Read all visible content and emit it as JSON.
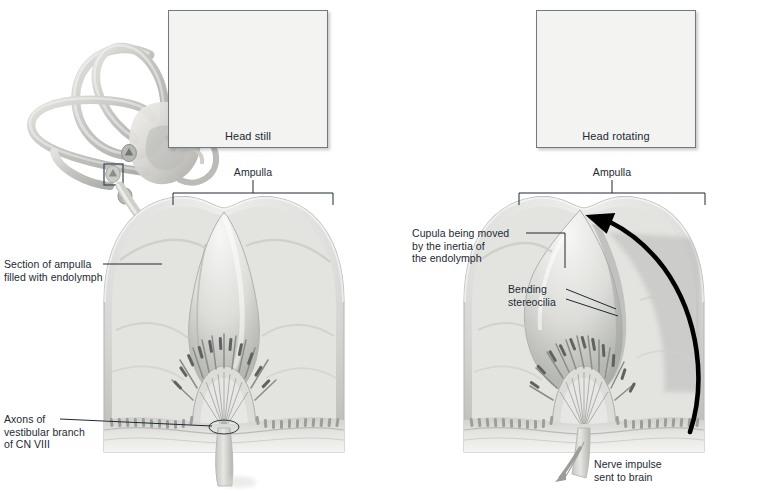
{
  "figure": {
    "background_color": "#ffffff",
    "ink_color": "#1d2a33",
    "art_tone_light": "#e9e9e7",
    "art_tone_mid": "#c9cac6",
    "art_tone_dark": "#9a9c98",
    "arrow_color": "#000000"
  },
  "panels": [
    {
      "id": "left",
      "name": "head-still-panel",
      "inset": {
        "name": "head-still-photo",
        "caption": "Head still",
        "pose": "front-facing woman, head stationary",
        "has_rotation_arrow": false
      },
      "bracket_label": "Ampulla",
      "callouts": [
        {
          "name": "section-of-ampulla-callout",
          "text": "Section of ampulla\nfilled with endolymph",
          "align": "left"
        },
        {
          "name": "axons-callout",
          "text": "Axons of\nvestibular branch\nof CN VIII",
          "align": "left"
        }
      ],
      "has_semicircular_canals": true,
      "has_magnifier_box": true,
      "has_pointer_arrow": true,
      "has_flow_arrow": false
    },
    {
      "id": "right",
      "name": "head-rotating-panel",
      "inset": {
        "name": "head-rotating-photo",
        "caption": "Head rotating",
        "pose": "three-quarter / profile woman, head turning",
        "has_rotation_arrow": true
      },
      "bracket_label": "Ampulla",
      "callouts": [
        {
          "name": "cupula-moved-callout",
          "text": "Cupula being moved\nby the inertia of\nthe endolymph",
          "align": "left"
        },
        {
          "name": "bending-stereocilia-callout",
          "text": "Bending\nstereocilia",
          "align": "left"
        },
        {
          "name": "nerve-impulse-callout",
          "text": "Nerve impulse\nsent to brain",
          "align": "left"
        }
      ],
      "has_semicircular_canals": false,
      "has_magnifier_box": false,
      "has_pointer_arrow": false,
      "has_flow_arrow": true
    }
  ],
  "anatomy_parts": [
    "semicircular canals",
    "ampulla",
    "cupula",
    "stereocilia",
    "hair cells",
    "crista ampullaris",
    "endolymph",
    "vestibular branch of CN VIII"
  ]
}
